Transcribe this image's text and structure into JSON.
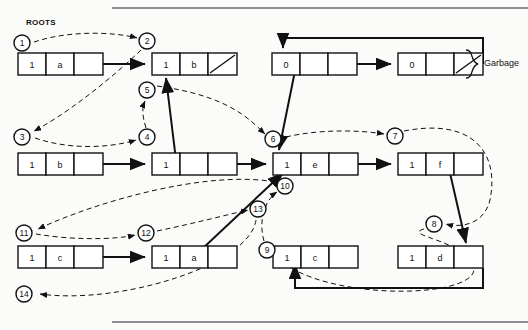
{
  "figure": {
    "title_label": "ROOTS",
    "garbage_label": "Garbage",
    "background": "#fbfbf9",
    "ink": "#111111"
  },
  "nodes": [
    {
      "id": "n-a",
      "label": "row1-node-a",
      "x": 18,
      "y": 53,
      "cells": [
        "1",
        "a",
        ""
      ],
      "nil": false
    },
    {
      "id": "n-b-top",
      "label": "row1-node-b",
      "x": 152,
      "y": 53,
      "cells": [
        "1",
        "b",
        ""
      ],
      "nil": true
    },
    {
      "id": "n-g1",
      "label": "garbage-node-1",
      "x": 272,
      "y": 53,
      "cells": [
        "0",
        "",
        ""
      ],
      "nil": false
    },
    {
      "id": "n-g2",
      "label": "garbage-node-2",
      "x": 398,
      "y": 53,
      "cells": [
        "0",
        "",
        ""
      ],
      "nil": true
    },
    {
      "id": "n-b-row2",
      "label": "row2-node-b",
      "x": 18,
      "y": 153,
      "cells": [
        "1",
        "b",
        ""
      ],
      "nil": false
    },
    {
      "id": "n-mid-row2",
      "label": "row2-node-middle",
      "x": 152,
      "y": 153,
      "cells": [
        "1",
        "",
        ""
      ],
      "nil": false
    },
    {
      "id": "n-e",
      "label": "row2-node-e",
      "x": 273,
      "y": 153,
      "cells": [
        "1",
        "e",
        ""
      ],
      "nil": false
    },
    {
      "id": "n-f",
      "label": "row2-node-f",
      "x": 398,
      "y": 153,
      "cells": [
        "1",
        "f",
        ""
      ],
      "nil": false
    },
    {
      "id": "n-c-row3",
      "label": "row3-node-c",
      "x": 18,
      "y": 246,
      "cells": [
        "1",
        "c",
        ""
      ],
      "nil": false
    },
    {
      "id": "n-a-row3",
      "label": "row3-node-a",
      "x": 152,
      "y": 246,
      "cells": [
        "1",
        "a",
        ""
      ],
      "nil": false
    },
    {
      "id": "n-c-row4",
      "label": "row4-node-c",
      "x": 273,
      "y": 246,
      "cells": [
        "1",
        "c",
        ""
      ],
      "nil": false
    },
    {
      "id": "n-d-row4",
      "label": "row4-node-d",
      "x": 398,
      "y": 246,
      "cells": [
        "1",
        "d",
        ""
      ],
      "nil": false
    }
  ],
  "step_markers": [
    {
      "n": "1",
      "x": 22,
      "y": 43
    },
    {
      "n": "2",
      "x": 147,
      "y": 41
    },
    {
      "n": "3",
      "x": 22,
      "y": 137
    },
    {
      "n": "4",
      "x": 147,
      "y": 137
    },
    {
      "n": "5",
      "x": 147,
      "y": 90
    },
    {
      "n": "6",
      "x": 273,
      "y": 139
    },
    {
      "n": "7",
      "x": 395,
      "y": 136
    },
    {
      "n": "8",
      "x": 434,
      "y": 224
    },
    {
      "n": "9",
      "x": 267,
      "y": 250
    },
    {
      "n": "10",
      "x": 285,
      "y": 186
    },
    {
      "n": "11",
      "x": 24,
      "y": 233
    },
    {
      "n": "12",
      "x": 146,
      "y": 233
    },
    {
      "n": "13",
      "x": 258,
      "y": 209
    },
    {
      "n": "14",
      "x": 24,
      "y": 294
    }
  ],
  "solid_pointers": [
    {
      "name": "a-to-b-top",
      "d": "M 73 64 L 145 64"
    },
    {
      "name": "b-row2-to-mid",
      "d": "M 73 164 L 145 164"
    },
    {
      "name": "mid-row2-to-e",
      "d": "M 207 164 L 266 164"
    },
    {
      "name": "e-to-f",
      "d": "M 328 164 L 391 164"
    },
    {
      "name": "c-row3-to-a-row3",
      "d": "M 73 257 L 145 257"
    },
    {
      "name": "g1-to-g2",
      "d": "M 327 64 L 391 64"
    },
    {
      "name": "g2-back-to-g1",
      "d": "M 483 64 L 483 38 L 283 38 L 283 48"
    },
    {
      "name": "d-row4-to-c-row4",
      "d": "M 483 268 L 483 288 L 295 288 L 295 264"
    },
    {
      "name": "g1-cell2-down",
      "d": "M 296 66 L 279 150"
    },
    {
      "name": "mid-row2-cell2-up",
      "d": "M 176 160 L 166 78"
    },
    {
      "name": "f-cell3-down",
      "d": "M 447 160 L 466 243"
    },
    {
      "name": "a-row3-cell3-up",
      "d": "M 201 250 L 283 173"
    }
  ],
  "dashed_pointers": [
    {
      "name": "m1-to-m2",
      "d": "M 34 42 C 70 30 115 32 137 38"
    },
    {
      "name": "m2-to-m3",
      "d": "M 141 50 C 110 80 65 115 34 131"
    },
    {
      "name": "m3-to-m4",
      "d": "M 35 138 C 70 150 110 148 136 140"
    },
    {
      "name": "m4-to-m5",
      "d": "M 146 128 C 142 115 142 108 145 101"
    },
    {
      "name": "m5-to-m6",
      "d": "M 157 86 C 230 96 250 120 265 134"
    },
    {
      "name": "m6-to-m7",
      "d": "M 286 137 C 320 129 360 130 384 134"
    },
    {
      "name": "m7-to-m8",
      "d": "M 404 131 C 470 118 500 150 490 200 C 484 225 460 228 446 224"
    },
    {
      "name": "m8-to-m9",
      "d": "M 424 229 C 400 236 470 240 474 270 C 470 300 320 300 278 258"
    },
    {
      "name": "m9-to-m10",
      "d": "M 264 241 C 258 220 265 200 277 192"
    },
    {
      "name": "m10-to-m11",
      "d": "M 275 182 C 210 170 100 200 38 229"
    },
    {
      "name": "m11-to-m12",
      "d": "M 36 234 C 70 240 115 240 135 235"
    },
    {
      "name": "m12-to-m13",
      "d": "M 157 231 C 200 222 230 214 248 210"
    },
    {
      "name": "m13-to-m14",
      "d": "M 256 220 C 250 265 120 305 40 294"
    }
  ]
}
